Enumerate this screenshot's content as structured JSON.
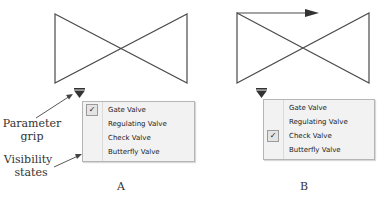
{
  "panels": [
    {
      "id": "A",
      "label": "A",
      "has_flow_arrow": false,
      "menu_items": [
        {
          "label": "Gate Valve",
          "checked": true
        },
        {
          "label": "Regulating Valve",
          "checked": false
        },
        {
          "label": "Check Valve",
          "checked": false
        },
        {
          "label": "Butterfly Valve",
          "checked": false
        }
      ]
    },
    {
      "id": "B",
      "label": "B",
      "has_flow_arrow": true,
      "menu_items": [
        {
          "label": "Gate Valve",
          "checked": false
        },
        {
          "label": "Regulating Valve",
          "checked": false
        },
        {
          "label": "Check Valve",
          "checked": true
        },
        {
          "label": "Butterfly Valve",
          "checked": false
        }
      ]
    }
  ],
  "callouts": {
    "parameter_grip": [
      "Parameter",
      "grip"
    ],
    "visibility_states": [
      "Visibility",
      "states"
    ]
  },
  "icons": {
    "check": "✓"
  },
  "colors": {
    "line": "#4a4a4a",
    "grip": "#333333",
    "menu_bg": "#f2f2f2",
    "menu_border": "#b5b5b5"
  }
}
